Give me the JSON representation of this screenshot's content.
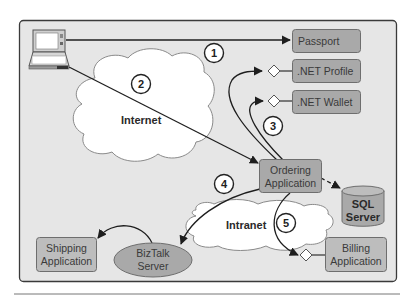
{
  "diagram": {
    "colors": {
      "frame_fill": "#e6e6e6",
      "frame_stroke": "#3a3a3a",
      "box_fill": "#a9a9a9",
      "box_fill_light": "#bdbdbd",
      "box_stroke": "#6e6e6e",
      "cloud_fill": "#ffffff",
      "cloud_stroke": "#8a8a8a",
      "line": "#1e1e1e"
    },
    "clouds": {
      "internet": "Internet",
      "intranet": "Intranet"
    },
    "nodes": {
      "passport": "Passport",
      "net_profile": ".NET Profile",
      "net_wallet": ".NET Wallet",
      "ordering_line1": "Ordering",
      "ordering_line2": "Application",
      "sql_line1": "SQL",
      "sql_line2": "Server",
      "billing_line1": "Billing",
      "billing_line2": "Application",
      "shipping_line1": "Shipping",
      "shipping_line2": "Application",
      "biztalk_line1": "BizTalk",
      "biztalk_line2": "Server"
    },
    "steps": [
      "1",
      "2",
      "3",
      "4",
      "5"
    ],
    "client_icon": "laptop-icon"
  }
}
